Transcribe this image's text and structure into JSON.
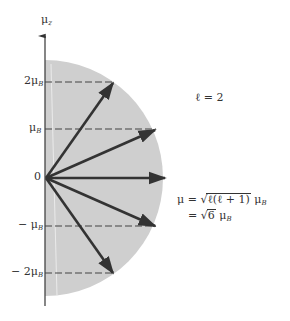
{
  "diagram": {
    "type": "vector-model-orbital-angular-momentum",
    "axis": {
      "label_main": "μ",
      "label_sub": "z"
    },
    "origin_label": "0",
    "tick_labels": [
      {
        "id": "plus2",
        "main": "2μ",
        "sub": "B",
        "value": 2
      },
      {
        "id": "plus1",
        "main": "μ",
        "sub": "B",
        "value": 1
      },
      {
        "id": "minus1",
        "main": "− μ",
        "sub": "B",
        "value": -1
      },
      {
        "id": "minus2",
        "main": "− 2μ",
        "sub": "B",
        "value": -2
      }
    ],
    "quantum_number_label": "ℓ = 2",
    "magnitude_equation": {
      "line1_lhs": "μ =",
      "line1_radicand": "ℓ(ℓ + 1)",
      "line1_unit_main": "μ",
      "line1_unit_sub": "B",
      "line2_lhs": "=",
      "line2_radicand": "6",
      "line2_unit_main": "μ",
      "line2_unit_sub": "B"
    },
    "vectors_mz": [
      2,
      1,
      0,
      -1,
      -2
    ],
    "colors": {
      "disc_fill": "#cfcfcf",
      "arrow": "#333333",
      "dashed_line": "#444444",
      "axis": "#444444"
    }
  }
}
